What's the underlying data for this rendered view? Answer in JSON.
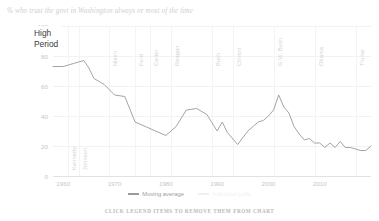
{
  "title": "% who trust the govt in Washington always or most of the time",
  "annotation": {
    "line1": "High",
    "line2": "Period"
  },
  "footnote": "CLICK LEGEND ITEMS TO REMOVE THEM FROM CHART",
  "legend": {
    "items": [
      {
        "label": "Moving average",
        "color": "#9a9a9a",
        "visible": true
      },
      {
        "label": "Individual polls",
        "color": "#f0f0f0",
        "visible": false
      }
    ]
  },
  "presidents": [
    {
      "name": "Eisenhower",
      "year": 1953
    },
    {
      "name": "Kennedy",
      "year": 1961
    },
    {
      "name": "Johnson",
      "year": 1963
    },
    {
      "name": "Nixon",
      "year": 1969
    },
    {
      "name": "Ford",
      "year": 1974
    },
    {
      "name": "Carter",
      "year": 1977
    },
    {
      "name": "Reagan",
      "year": 1981
    },
    {
      "name": "Bush",
      "year": 1989
    },
    {
      "name": "Clinton",
      "year": 1993
    },
    {
      "name": "G.W. Bush",
      "year": 2001
    },
    {
      "name": "Obama",
      "year": 2009
    },
    {
      "name": "Trump",
      "year": 2017
    }
  ],
  "chart_data": {
    "type": "line",
    "title": "% who trust the govt in Washington always or most of the time",
    "xlabel": "",
    "ylabel": "",
    "xlim": [
      1958,
      2020
    ],
    "ylim": [
      0,
      100
    ],
    "grid": true,
    "legend_position": "bottom",
    "xticks": [
      1960,
      1970,
      1980,
      1990,
      2000,
      2010
    ],
    "yticks": [
      0,
      20,
      40,
      60,
      80,
      100
    ],
    "series": [
      {
        "name": "Moving average",
        "color": "#9a9a9a",
        "x": [
          1958,
          1960,
          1962,
          1964,
          1965,
          1966,
          1968,
          1970,
          1972,
          1974,
          1976,
          1978,
          1980,
          1982,
          1984,
          1986,
          1988,
          1990,
          1991,
          1992,
          1994,
          1996,
          1997,
          1998,
          1999,
          2000,
          2001,
          2002,
          2003,
          2004,
          2005,
          2006,
          2007,
          2008,
          2009,
          2010,
          2011,
          2012,
          2013,
          2014,
          2015,
          2016,
          2017,
          2018,
          2019,
          2020
        ],
        "values": [
          73,
          73,
          75,
          77,
          72,
          65,
          61,
          54,
          53,
          36,
          33,
          30,
          27,
          33,
          44,
          45,
          41,
          30,
          36,
          29,
          21,
          30,
          33,
          36,
          37,
          40,
          44,
          54,
          46,
          42,
          33,
          28,
          24,
          25,
          22,
          22,
          19,
          22,
          19,
          23,
          19,
          19,
          18,
          17,
          17,
          20
        ]
      }
    ]
  }
}
